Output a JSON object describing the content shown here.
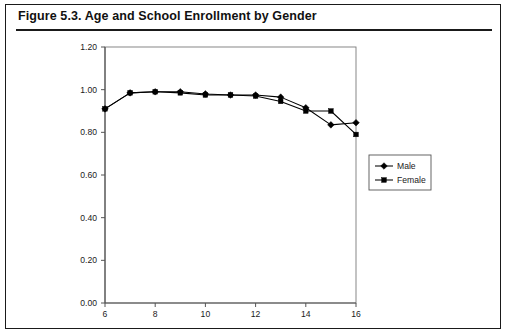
{
  "figure": {
    "label": "Figure 5.3.",
    "title": "Figure 5.3.  Age and School Enrollment by Gender"
  },
  "chart_data": {
    "type": "line",
    "title": "Age and School Enrollment by Gender",
    "xlabel": "",
    "ylabel": "",
    "x": [
      6,
      7,
      8,
      9,
      10,
      11,
      12,
      13,
      14,
      15,
      16
    ],
    "xlim": [
      6,
      16
    ],
    "ylim": [
      0.0,
      1.2
    ],
    "xticks": [
      6,
      8,
      10,
      12,
      14,
      16
    ],
    "xtick_labels": [
      "6",
      "8",
      "10",
      "12",
      "14",
      "16"
    ],
    "yticks": [
      0.0,
      0.2,
      0.4,
      0.6,
      0.8,
      1.0,
      1.2
    ],
    "ytick_labels": [
      "0.00",
      "0.20",
      "0.40",
      "0.60",
      "0.80",
      "1.00",
      "1.20"
    ],
    "grid": false,
    "legend_position": "right",
    "series": [
      {
        "name": "Male",
        "marker": "diamond",
        "color": "#000000",
        "values": [
          0.91,
          0.985,
          0.99,
          0.99,
          0.98,
          0.975,
          0.975,
          0.965,
          0.915,
          0.835,
          0.845
        ]
      },
      {
        "name": "Female",
        "marker": "square",
        "color": "#000000",
        "values": [
          0.91,
          0.985,
          0.99,
          0.985,
          0.975,
          0.975,
          0.97,
          0.945,
          0.9,
          0.9,
          0.79
        ]
      }
    ]
  },
  "legend": {
    "entries": [
      {
        "label": "Male",
        "marker": "diamond"
      },
      {
        "label": "Female",
        "marker": "square"
      }
    ]
  }
}
